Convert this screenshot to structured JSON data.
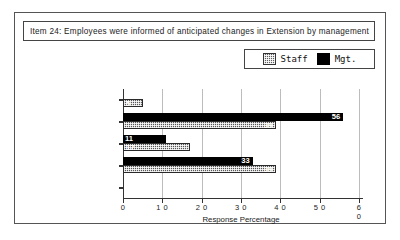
{
  "figure": {
    "title": "Item 24:  Employees were informed of anticipated changes in Extension by management"
  },
  "legend": {
    "position": "top-right",
    "entries": [
      {
        "label": "Staff",
        "swatch": "staff-pattern-swatch",
        "color": "#565656"
      },
      {
        "label": "Mgt.",
        "swatch": "mgt-solid-swatch",
        "color": "#000000"
      }
    ]
  },
  "chart_data": {
    "type": "bar",
    "orientation": "horizontal",
    "title": "Item 24:  Employees were informed of anticipated changes in Extension by management",
    "xlabel": "Response Percentage",
    "ylabel": "",
    "categories": [
      "strongly  disagree",
      "disagree",
      "neutral (no knowledge)",
      "agree",
      "strongly  agree"
    ],
    "series": [
      {
        "name": "Staff",
        "color": "#565656",
        "values": [
          5,
          39,
          17,
          39,
          0
        ]
      },
      {
        "name": "Mgt.",
        "color": "#000000",
        "values": [
          0,
          56,
          11,
          33,
          0
        ]
      }
    ],
    "xlim": [
      0,
      60
    ],
    "xticks": [
      0,
      10,
      20,
      30,
      40,
      50,
      60
    ],
    "xtick_labels": [
      "0",
      "1 0",
      "2 0",
      "3 0",
      "4 0",
      "5 0",
      "6 0"
    ],
    "grid": true,
    "legend_position": "top-right"
  }
}
